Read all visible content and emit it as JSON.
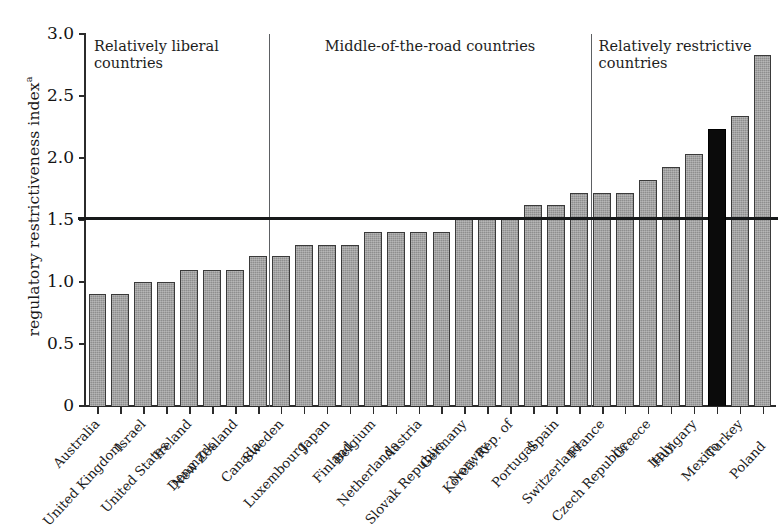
{
  "chart_data": {
    "type": "bar",
    "title": "",
    "xlabel": "",
    "ylabel": "regulatory restrictiveness index",
    "ylabel_superscript": "a",
    "ylim": [
      0,
      3.0
    ],
    "ytick_labels": [
      "0",
      "0.5",
      "1.0",
      "1.5",
      "2.0",
      "2.5",
      "3.0"
    ],
    "ytick_values": [
      0,
      0.5,
      1.0,
      1.5,
      2.0,
      2.5,
      3.0
    ],
    "grid": false,
    "legend_position": "none",
    "reference_line": {
      "value": 1.52,
      "label": ""
    },
    "highlight_country": "Mexico",
    "highlight_color": "#0b0b0b",
    "bar_color": "#8e8e8e",
    "bar_edge_color": "#3a3a3a",
    "categories": [
      "Australia",
      "United Kingdom",
      "Israel",
      "United States",
      "Ireland",
      "Denmark",
      "New Zealand",
      "Canada",
      "Sweden",
      "Luxembourg",
      "Japan",
      "Finland",
      "Belgium",
      "Netherlands",
      "Austria",
      "Slovak Republic",
      "Germany",
      "Norway",
      "Korea, Rep. of",
      "Portugal",
      "Spain",
      "Switzerland",
      "France",
      "Czech Republic",
      "Greece",
      "Italy",
      "Hungary",
      "Mexico",
      "Turkey",
      "Poland"
    ],
    "values": [
      0.9,
      0.9,
      1.0,
      1.0,
      1.1,
      1.1,
      1.1,
      1.21,
      1.21,
      1.3,
      1.3,
      1.3,
      1.4,
      1.4,
      1.4,
      1.4,
      1.51,
      1.51,
      1.51,
      1.62,
      1.62,
      1.72,
      1.72,
      1.72,
      1.82,
      1.93,
      2.03,
      2.23,
      2.34,
      2.83
    ],
    "sections": [
      {
        "label": "Relatively liberal\ncountries",
        "start_index": 0,
        "end_index": 7
      },
      {
        "label": "Middle-of-the-road countries",
        "start_index": 8,
        "end_index": 21
      },
      {
        "label": "Relatively restrictive\ncountries",
        "start_index": 22,
        "end_index": 29
      }
    ]
  }
}
